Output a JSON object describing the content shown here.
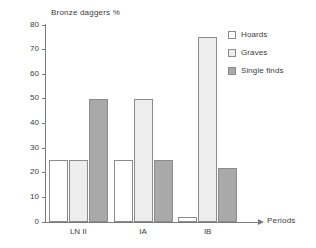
{
  "chart_data": {
    "type": "bar",
    "title": "Bronze daggers %",
    "xlabel": "Periods",
    "ylabel": "",
    "categories": [
      "LN II",
      "IA",
      "IB"
    ],
    "series": [
      {
        "name": "Hoards",
        "color": "#ffffff",
        "values": [
          25,
          25,
          2
        ]
      },
      {
        "name": "Graves",
        "color": "#ededed",
        "values": [
          25,
          50,
          75
        ]
      },
      {
        "name": "Single finds",
        "color": "#a9a9a9",
        "values": [
          50,
          25,
          22
        ]
      }
    ],
    "ylim": [
      0,
      80
    ],
    "yticks": [
      0,
      10,
      20,
      30,
      40,
      50,
      60,
      70,
      80
    ],
    "ytick_labels": [
      "0",
      "10",
      "20",
      "30",
      "40",
      "50",
      "60",
      "70",
      "80"
    ],
    "grid": false,
    "legend_position": "right"
  },
  "axis": {
    "x_arrow_icon": "arrow-right-icon"
  }
}
